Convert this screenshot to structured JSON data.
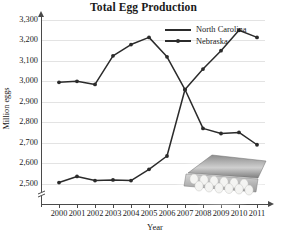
{
  "chart_data": {
    "type": "line",
    "title": "Total Egg Production",
    "xlabel": "Year",
    "ylabel": "Million eggs",
    "categories": [
      "2000",
      "2001",
      "2002",
      "2003",
      "2004",
      "2005",
      "2006",
      "2007",
      "2008",
      "2009",
      "2010",
      "2011"
    ],
    "ylim": [
      2450,
      3350
    ],
    "yticks": [
      2500,
      2600,
      2700,
      2800,
      2900,
      3000,
      3100,
      3200,
      3300
    ],
    "ytick_labels": [
      "2,500",
      "2,600",
      "2,700",
      "2,800",
      "2,900",
      "3,000",
      "3,100",
      "3,200",
      "3,300"
    ],
    "grid": true,
    "axis_break": true,
    "legend_position": "top-right",
    "series": [
      {
        "name": "North Carolina",
        "color": "#2b2b2b",
        "values": [
          2505,
          2535,
          2515,
          2518,
          2515,
          2570,
          2635,
          2960,
          3060,
          3150,
          3250,
          3215
        ]
      },
      {
        "name": "Nebraska",
        "color": "#2b2b2b",
        "values": [
          2995,
          3000,
          2985,
          3125,
          3180,
          3215,
          3120,
          2960,
          2770,
          2745,
          2750,
          2690
        ]
      }
    ],
    "annotations": [
      {
        "name": "egg-carton-photo",
        "description": "Photograph of an open carton of twelve white eggs",
        "x": 2008,
        "y": 2560
      }
    ]
  }
}
